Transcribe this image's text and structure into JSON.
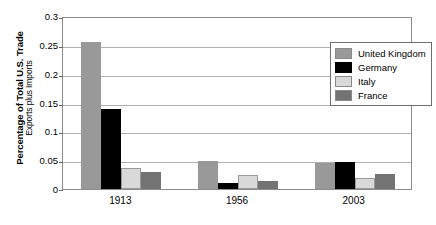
{
  "chart_data": {
    "type": "bar",
    "title": "",
    "subtitle": "",
    "xlabel": "",
    "ylabel": "Percentage of Total U.S. Trade",
    "ylabel_line2": "Exports plus Imports",
    "categories": [
      "1913",
      "1956",
      "2003"
    ],
    "series": [
      {
        "name": "United Kingdom",
        "color": "#999999",
        "values": [
          0.255,
          0.049,
          0.045
        ]
      },
      {
        "name": "Germany",
        "color": "#000000",
        "values": [
          0.138,
          0.01,
          0.047
        ]
      },
      {
        "name": "Italy",
        "color": "#d9d9d9",
        "values": [
          0.036,
          0.024,
          0.019
        ]
      },
      {
        "name": "France",
        "color": "#737373",
        "values": [
          0.029,
          0.014,
          0.026
        ]
      }
    ],
    "ylim": [
      0,
      0.3
    ],
    "yticks": [
      0,
      0.05,
      0.1,
      0.15,
      0.2,
      0.25,
      0.3
    ],
    "ytick_labels": [
      "0",
      "0.05",
      "0.1",
      "0.15",
      "0.2",
      "0.25",
      "0.3"
    ],
    "grid": true,
    "legend_position": "top-right-inside"
  },
  "legend": {
    "entries": [
      {
        "label": "United Kingdom",
        "color": "#999999"
      },
      {
        "label": "Germany",
        "color": "#000000"
      },
      {
        "label": "Italy",
        "color": "#d9d9d9"
      },
      {
        "label": "France",
        "color": "#737373"
      }
    ]
  }
}
